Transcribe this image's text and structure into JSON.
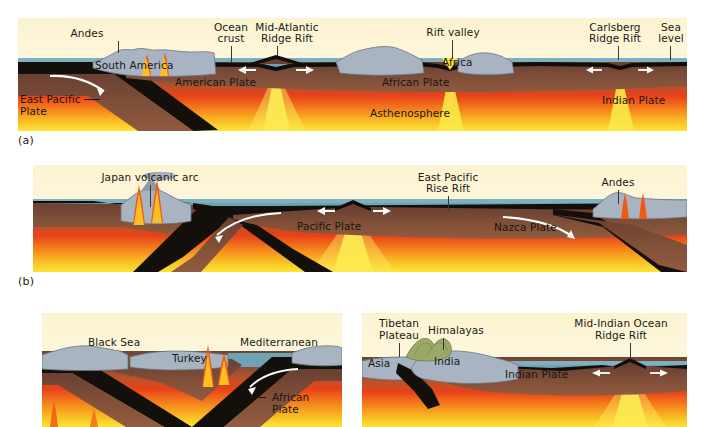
{
  "figure": {
    "background_color": "#ffffff",
    "panels": [
      {
        "id": "a",
        "letter": "(a)",
        "labels": [
          "Andes",
          "South America",
          "Ocean crust",
          "Mid-Atlantic Ridge Rift",
          "Rift valley",
          "Carlsberg Ridge Rift",
          "Sea level",
          "East Pacific Plate",
          "American Plate",
          "African Plate",
          "Africa",
          "Indian Plate",
          "Asthenosphere"
        ]
      },
      {
        "id": "b",
        "letter": "(b)",
        "labels": [
          "Japan volcanic arc",
          "East Pacific Rise Rift",
          "Andes",
          "Pacific Plate",
          "Nazca Plate"
        ]
      },
      {
        "id": "c",
        "letter": "",
        "labels": [
          "Black Sea",
          "Turkey",
          "Mediterranean",
          "African Plate"
        ]
      },
      {
        "id": "d",
        "letter": "",
        "labels": [
          "Tibetan Plateau",
          "Himalayas",
          "Mid-Indian Ocean Ridge Rift",
          "Asia",
          "India",
          "Indian Plate"
        ]
      }
    ]
  },
  "panel_a": {
    "letter": "(a)",
    "label_andes": "Andes",
    "label_south_america": "South America",
    "label_ocean_crust_1": "Ocean",
    "label_ocean_crust_2": "crust",
    "label_mid_atlantic_1": "Mid-Atlantic",
    "label_mid_atlantic_2": "Ridge Rift",
    "label_rift_valley": "Rift valley",
    "label_carlsberg_1": "Carlsberg",
    "label_carlsberg_2": "Ridge Rift",
    "label_sea_1": "Sea",
    "label_sea_2": "level",
    "label_east_pacific_1": "East Pacific",
    "label_east_pacific_2": "Plate",
    "label_american_plate": "American Plate",
    "label_african_plate": "African Plate",
    "label_africa": "Africa",
    "label_indian_plate": "Indian Plate",
    "label_asthenosphere": "Asthenosphere"
  },
  "panel_b": {
    "letter": "(b)",
    "label_japan_arc": "Japan volcanic arc",
    "label_east_pacific_rise_1": "East Pacific",
    "label_east_pacific_rise_2": "Rise Rift",
    "label_andes": "Andes",
    "label_pacific_plate": "Pacific Plate",
    "label_nazca_plate": "Nazca Plate"
  },
  "panel_c": {
    "label_black_sea": "Black Sea",
    "label_turkey": "Turkey",
    "label_mediterranean": "Mediterranean",
    "label_african_plate_1": "African",
    "label_african_plate_2": "Plate"
  },
  "panel_d": {
    "label_tibetan_1": "Tibetan",
    "label_tibetan_2": "Plateau",
    "label_himalayas": "Himalayas",
    "label_mid_indian_1": "Mid-Indian Ocean",
    "label_mid_indian_2": "Ridge Rift",
    "label_asia": "Asia",
    "label_india": "India",
    "label_indian_plate": "Indian Plate"
  },
  "colors": {
    "sky_top": "#fdf7dd",
    "sky_bottom": "#fefcf0",
    "ocean_water": "#6ea3b5",
    "crust_black": "#100d0a",
    "lithosphere_brown": "#7a4f3a",
    "mantle_red": "#e8421a",
    "mantle_orange": "#f58a17",
    "mantle_yellow": "#fbe033",
    "continent_gray": "#a8b4c2",
    "magma_orange": "#f4861f",
    "magma_red": "#ec3f14",
    "himalaya_green": "#9aa868",
    "arrow_white": "#ffffff",
    "label_text": "#1b1916"
  }
}
